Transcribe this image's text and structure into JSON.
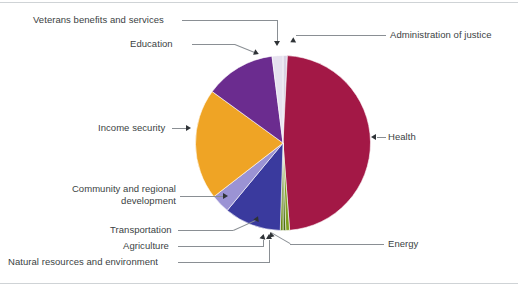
{
  "chart_data": {
    "type": "pie",
    "title": "",
    "subtitle": "",
    "xlabel": "",
    "ylabel": "",
    "legend_position": "callout-labels",
    "grid": false,
    "start_angle_deg": 0,
    "direction": "clockwise",
    "categories": [
      "Administration of justice",
      "Health",
      "Energy",
      "Agriculture",
      "Natural resources and environment",
      "Transportation",
      "Community and regional development",
      "Income security",
      "Education",
      "Veterans benefits and services"
    ],
    "values": [
      0.8,
      48.0,
      0.7,
      0.5,
      0.5,
      10.5,
      3.5,
      20.5,
      13.0,
      2.0
    ],
    "colors": [
      "#d8d2e4",
      "#a31846",
      "#7f9f1e",
      "#4f6f12",
      "#6a8a16",
      "#3a3a9e",
      "#9b93d4",
      "#efa425",
      "#6b2c8f",
      "#e6e2ef"
    ]
  },
  "callouts": {
    "veterans": {
      "label": "Veterans benefits and services"
    },
    "education": {
      "label": "Education"
    },
    "income_security": {
      "label": "Income security"
    },
    "community": {
      "label": "Community and regional\ndevelopment",
      "line1": "Community and regional",
      "line2": "development"
    },
    "transportation": {
      "label": "Transportation"
    },
    "agriculture": {
      "label": "Agriculture"
    },
    "natural_resources": {
      "label": "Natural resources and environment"
    },
    "administration_of_justice": {
      "label": "Administration of justice"
    },
    "health": {
      "label": "Health"
    },
    "energy": {
      "label": "Energy"
    }
  },
  "colors": {
    "health": "#a31846",
    "education": "#6b2c8f",
    "income_security": "#efa425",
    "transportation": "#3a3a9e",
    "community": "#9b93d4",
    "energy": "#7f9f1e",
    "veterans": "#e6e2ef",
    "administration_of_justice": "#d8d2e4",
    "leader_line": "#8a8f94",
    "text": "#3b3f43",
    "background": "#ffffff"
  }
}
